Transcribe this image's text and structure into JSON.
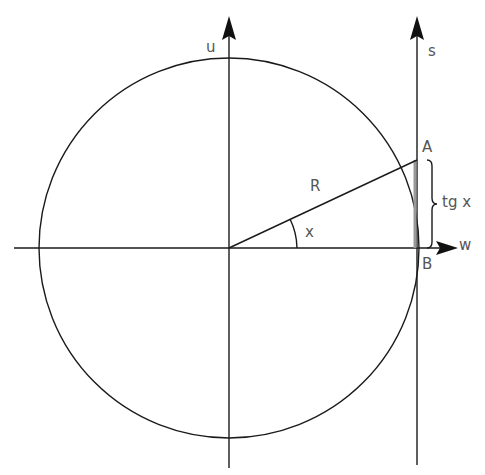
{
  "diagram": {
    "labels": {
      "u_axis": "u",
      "s_axis": "s",
      "w_axis": "w",
      "point_a": "A",
      "point_b": "B",
      "radius": "R",
      "angle": "x",
      "tangent": "tg x"
    },
    "geometry": {
      "center": [
        229,
        248
      ],
      "radius": 190,
      "point_a": [
        417,
        160
      ],
      "point_b": [
        417,
        248
      ]
    },
    "colors": {
      "line": "#1a1a1a",
      "text": "#555555",
      "tangent_segment": "#999999"
    }
  }
}
